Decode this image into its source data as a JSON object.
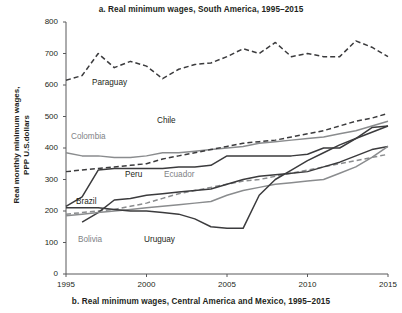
{
  "title": "a. Real minimum wages, South America, 1995–2015",
  "caption": "b. Real minimum wages, Central America and Mexico, 1995–2015",
  "axis": {
    "ylabel": "Real monthly minimum wages,\nPPP U.S.dollars",
    "yticks": [
      "0",
      "100",
      "200",
      "300",
      "400",
      "500",
      "600",
      "700",
      "800"
    ],
    "xticks": [
      "1995",
      "2000",
      "2005",
      "2010",
      "2015"
    ]
  },
  "colors": {
    "dark": "#3b3b3d",
    "gray": "#8a8c8e",
    "axis": "#58595b",
    "text": "#231f20"
  },
  "labels": [
    {
      "name": "Paraguay",
      "x": 26,
      "y": 56,
      "tone": "dark"
    },
    {
      "name": "Colombia",
      "x": 5,
      "y": 110,
      "tone": "gray"
    },
    {
      "name": "Chile",
      "x": 91,
      "y": 94,
      "tone": "dark"
    },
    {
      "name": "Peru",
      "x": 59,
      "y": 148,
      "tone": "dark"
    },
    {
      "name": "Ecuador",
      "x": 98,
      "y": 148,
      "tone": "gray"
    },
    {
      "name": "Brazil",
      "x": 10,
      "y": 175,
      "tone": "dark"
    },
    {
      "name": "Bolivia",
      "x": 12,
      "y": 213,
      "tone": "gray"
    },
    {
      "name": "Uruguay",
      "x": 78,
      "y": 213,
      "tone": "dark"
    }
  ],
  "chart_data": {
    "type": "line",
    "title": "a. Real minimum wages, South America, 1995–2015",
    "subtitle": "b. Real minimum wages, Central America and Mexico, 1995–2015",
    "xlabel": "",
    "ylabel": "Real monthly minimum wages, PPP U.S.dollars",
    "xlim": [
      1995,
      2015
    ],
    "ylim": [
      0,
      800
    ],
    "ytick_step": 100,
    "grid": false,
    "legend": "inline-labels",
    "x": [
      1995,
      1996,
      1997,
      1998,
      1999,
      2000,
      2001,
      2002,
      2003,
      2004,
      2005,
      2006,
      2007,
      2008,
      2009,
      2010,
      2011,
      2012,
      2013,
      2014,
      2015
    ],
    "series": [
      {
        "name": "Paraguay",
        "style": "dashed",
        "color": "#3b3b3d",
        "values": [
          615,
          630,
          700,
          655,
          675,
          660,
          620,
          650,
          665,
          670,
          690,
          715,
          700,
          735,
          690,
          700,
          690,
          690,
          740,
          720,
          690
        ]
      },
      {
        "name": "Colombia",
        "style": "solid",
        "color": "#8a8c8e",
        "values": [
          385,
          375,
          375,
          370,
          370,
          375,
          385,
          385,
          390,
          395,
          400,
          405,
          415,
          420,
          425,
          430,
          435,
          445,
          455,
          470,
          485
        ]
      },
      {
        "name": "Chile",
        "style": "dashed",
        "color": "#3b3b3d",
        "values": [
          325,
          330,
          335,
          340,
          345,
          350,
          365,
          375,
          385,
          395,
          405,
          415,
          420,
          425,
          435,
          445,
          455,
          470,
          485,
          495,
          510
        ]
      },
      {
        "name": "Peru",
        "style": "solid",
        "color": "#3b3b3d",
        "values": [
          215,
          245,
          330,
          335,
          335,
          335,
          335,
          340,
          340,
          345,
          375,
          375,
          375,
          375,
          375,
          380,
          400,
          400,
          430,
          465,
          470
        ]
      },
      {
        "name": "Ecuador",
        "style": "dashed",
        "color": "#8a8c8e",
        "values": [
          190,
          195,
          200,
          205,
          215,
          225,
          240,
          255,
          265,
          275,
          285,
          295,
          300,
          310,
          320,
          330,
          340,
          350,
          360,
          370,
          380
        ]
      },
      {
        "name": "Brazil",
        "style": "solid",
        "color": "#3b3b3d",
        "values": [
          null,
          165,
          195,
          235,
          240,
          250,
          255,
          260,
          265,
          270,
          285,
          300,
          310,
          315,
          320,
          325,
          340,
          355,
          375,
          395,
          405
        ]
      },
      {
        "name": "Bolivia",
        "style": "solid",
        "color": "#8a8c8e",
        "values": [
          185,
          190,
          195,
          200,
          205,
          210,
          215,
          220,
          225,
          230,
          250,
          265,
          275,
          285,
          290,
          295,
          300,
          320,
          340,
          370,
          405
        ]
      },
      {
        "name": "Uruguay",
        "style": "solid",
        "color": "#3b3b3d",
        "values": [
          210,
          210,
          210,
          205,
          200,
          200,
          195,
          190,
          175,
          150,
          145,
          145,
          250,
          300,
          330,
          360,
          385,
          410,
          430,
          450,
          470
        ]
      }
    ]
  }
}
